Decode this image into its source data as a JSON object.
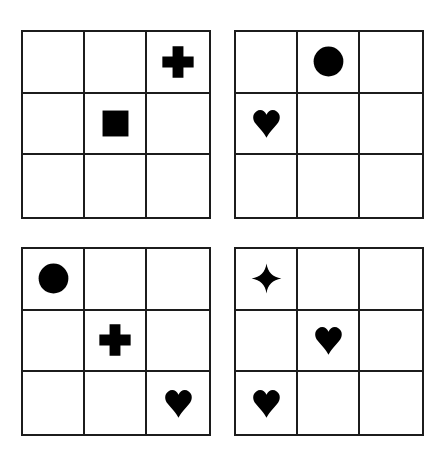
{
  "page": {
    "background_color": "#ffffff",
    "width": 448,
    "height": 454
  },
  "style": {
    "line_color": "#1c1c1c",
    "shape_color": "#000000",
    "line_width_px": 2
  },
  "grids": [
    {
      "id": "grid-top-left",
      "position": "top-left",
      "rows": 3,
      "columns": 3,
      "cells": [
        {
          "row": 0,
          "col": 0,
          "shape": "empty"
        },
        {
          "row": 0,
          "col": 1,
          "shape": "empty"
        },
        {
          "row": 0,
          "col": 2,
          "shape": "plus"
        },
        {
          "row": 1,
          "col": 0,
          "shape": "empty"
        },
        {
          "row": 1,
          "col": 1,
          "shape": "square"
        },
        {
          "row": 1,
          "col": 2,
          "shape": "empty"
        },
        {
          "row": 2,
          "col": 0,
          "shape": "empty"
        },
        {
          "row": 2,
          "col": 1,
          "shape": "empty"
        },
        {
          "row": 2,
          "col": 2,
          "shape": "empty"
        }
      ]
    },
    {
      "id": "grid-top-right",
      "position": "top-right",
      "rows": 3,
      "columns": 3,
      "cells": [
        {
          "row": 0,
          "col": 0,
          "shape": "empty"
        },
        {
          "row": 0,
          "col": 1,
          "shape": "circle"
        },
        {
          "row": 0,
          "col": 2,
          "shape": "empty"
        },
        {
          "row": 1,
          "col": 0,
          "shape": "heart"
        },
        {
          "row": 1,
          "col": 1,
          "shape": "empty"
        },
        {
          "row": 1,
          "col": 2,
          "shape": "empty"
        },
        {
          "row": 2,
          "col": 0,
          "shape": "empty"
        },
        {
          "row": 2,
          "col": 1,
          "shape": "empty"
        },
        {
          "row": 2,
          "col": 2,
          "shape": "empty"
        }
      ]
    },
    {
      "id": "grid-bottom-left",
      "position": "bottom-left",
      "rows": 3,
      "columns": 3,
      "cells": [
        {
          "row": 0,
          "col": 0,
          "shape": "circle"
        },
        {
          "row": 0,
          "col": 1,
          "shape": "empty"
        },
        {
          "row": 0,
          "col": 2,
          "shape": "empty"
        },
        {
          "row": 1,
          "col": 0,
          "shape": "empty"
        },
        {
          "row": 1,
          "col": 1,
          "shape": "plus"
        },
        {
          "row": 1,
          "col": 2,
          "shape": "empty"
        },
        {
          "row": 2,
          "col": 0,
          "shape": "empty"
        },
        {
          "row": 2,
          "col": 1,
          "shape": "empty"
        },
        {
          "row": 2,
          "col": 2,
          "shape": "heart"
        }
      ]
    },
    {
      "id": "grid-bottom-right",
      "position": "bottom-right",
      "rows": 3,
      "columns": 3,
      "cells": [
        {
          "row": 0,
          "col": 0,
          "shape": "star"
        },
        {
          "row": 0,
          "col": 1,
          "shape": "empty"
        },
        {
          "row": 0,
          "col": 2,
          "shape": "empty"
        },
        {
          "row": 1,
          "col": 0,
          "shape": "empty"
        },
        {
          "row": 1,
          "col": 1,
          "shape": "heart"
        },
        {
          "row": 1,
          "col": 2,
          "shape": "empty"
        },
        {
          "row": 2,
          "col": 0,
          "shape": "heart"
        },
        {
          "row": 2,
          "col": 1,
          "shape": "empty"
        },
        {
          "row": 2,
          "col": 2,
          "shape": "empty"
        }
      ]
    }
  ],
  "shape_legend": {
    "plus": "plus-icon",
    "square": "square-icon",
    "circle": "circle-icon",
    "heart": "heart-icon",
    "star": "four-point-star-icon",
    "empty": "empty-cell"
  }
}
